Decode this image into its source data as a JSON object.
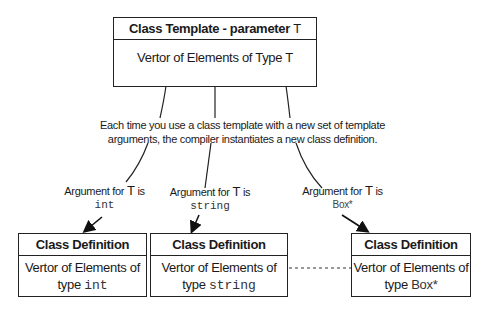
{
  "template": {
    "title_prefix": "Class Template - parameter ",
    "title_param": "T",
    "body_prefix": "Vertor of Elements of Type ",
    "body_param": "T"
  },
  "note": {
    "line1": "Each time you use a class template with a new set of template",
    "line2": "arguments, the compiler instantiates a new class definition."
  },
  "arguments": [
    {
      "prefix": "Argument for ",
      "param": "T",
      "suffix": " is",
      "value": "int"
    },
    {
      "prefix": "Argument for ",
      "param": "T",
      "suffix": " is",
      "value": "string"
    },
    {
      "prefix": "Argument for ",
      "param": "T",
      "suffix": " is",
      "value": "Box*"
    }
  ],
  "definitions": [
    {
      "title": "Class Definition",
      "line1": "Vertor of Elements of",
      "type_word": "type ",
      "type_value": "int"
    },
    {
      "title": "Class Definition",
      "line1": "Vertor of Elements of",
      "type_word": "type ",
      "type_value": "string"
    },
    {
      "title": "Class Definition",
      "line1": "Vertor of Elements of",
      "type_word": "type ",
      "type_value": "Box*"
    }
  ]
}
